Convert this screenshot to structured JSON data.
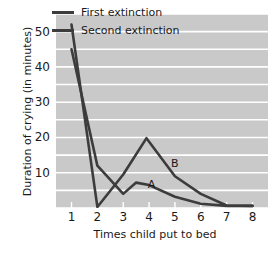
{
  "chart_data": {
    "type": "line",
    "title": "",
    "xlabel": "Times child put to bed",
    "ylabel": "Duration of crying (in minutes)",
    "xlim": [
      0.4,
      8.6
    ],
    "ylim": [
      0,
      55
    ],
    "grid": true,
    "grid_orientation": "horizontal",
    "grid_step": 5,
    "grid_color": "#ffffff",
    "plot_background": "#c9c9c9",
    "line_color": "#3c3c3c",
    "legend_position": "top-right-inside",
    "xticks": [
      1,
      2,
      3,
      4,
      5,
      6,
      7,
      8
    ],
    "xtick_labels": [
      "1",
      "2",
      "3",
      "4",
      "5",
      "6",
      "7",
      "8"
    ],
    "yticks": [
      10,
      20,
      30,
      40,
      50
    ],
    "ytick_labels": [
      "10",
      "20",
      "30",
      "40",
      "50"
    ],
    "series": [
      {
        "name": "First extinction",
        "annotation": "B",
        "x": [
          1,
          2,
          3,
          3.9,
          5,
          6,
          7,
          8
        ],
        "values": [
          52,
          0.3,
          9.5,
          19.8,
          9,
          4,
          0.7,
          0.6
        ]
      },
      {
        "name": "Second extinction",
        "annotation": "A",
        "x": [
          1,
          2,
          3,
          3.5,
          4,
          5,
          6,
          7,
          8
        ],
        "values": [
          45,
          12,
          4,
          7.2,
          6.5,
          3.2,
          1.2,
          0.6,
          0.6
        ]
      }
    ],
    "annotations": [
      {
        "text": "A",
        "x": 4.1,
        "y": 6.5
      },
      {
        "text": "B",
        "x": 5.0,
        "y": 12.5
      }
    ]
  },
  "legend": {
    "items": [
      {
        "label": "First extinction"
      },
      {
        "label": "Second extinction"
      }
    ]
  }
}
